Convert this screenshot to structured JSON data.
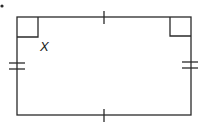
{
  "figure": {
    "type": "rectangle",
    "vertex_label": "X",
    "stroke_color": "#2a2a2a",
    "background": "#ffffff",
    "marks": {
      "top_side": "single-tick",
      "bottom_side": "single-tick",
      "left_side": "double-tick",
      "right_side": "double-tick",
      "right_angle_corners": [
        "top-left",
        "top-right"
      ]
    },
    "bullet": "•"
  }
}
